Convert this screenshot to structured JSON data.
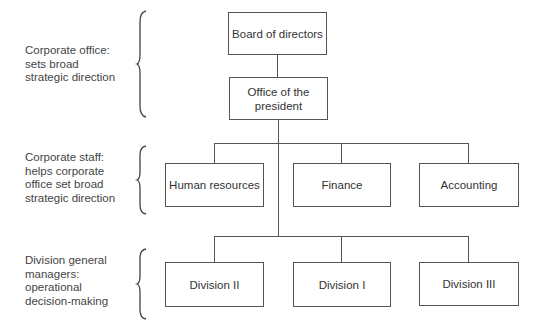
{
  "levels": [
    {
      "label": "Corporate office: sets broad strategic direction",
      "lines": [
        "Corporate office:",
        "sets broad",
        "strategic direction"
      ]
    },
    {
      "label": "Corporate staff: helps corporate office set broad strategic direction",
      "lines": [
        "Corporate staff:",
        "helps corporate",
        "office set broad",
        "strategic direction"
      ]
    },
    {
      "label": "Division general managers: operational decision-making",
      "lines": [
        "Division general",
        "managers:",
        "operational",
        "decision-making"
      ]
    }
  ],
  "nodes": {
    "board": {
      "lines": [
        "Board of directors"
      ]
    },
    "president": {
      "lines": [
        "Office of the",
        "president"
      ]
    },
    "staff": [
      {
        "label": "Human resources"
      },
      {
        "label": "Finance"
      },
      {
        "label": "Accounting"
      }
    ],
    "divisions": [
      {
        "label": "Division II"
      },
      {
        "label": "Division I"
      },
      {
        "label": "Division III"
      }
    ]
  },
  "colors": {
    "line": "#555555",
    "text": "#444444",
    "background": "#ffffff"
  }
}
